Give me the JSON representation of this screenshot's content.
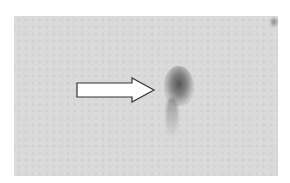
{
  "image": {
    "description": "Grayscale blot/microscopy panel with a dark spot indicated by a white arrow",
    "panel_color": "#d9d9d9",
    "spot_color": "#505050",
    "arrow": {
      "fill": "#ffffff",
      "stroke": "#333333",
      "direction": "right"
    }
  }
}
